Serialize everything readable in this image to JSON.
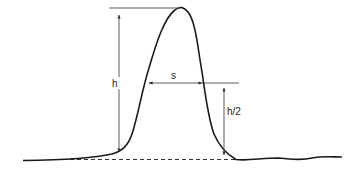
{
  "diagram": {
    "colors": {
      "line": "#1a1a1a",
      "annotation": "#333333",
      "background": "#ffffff"
    },
    "labels": {
      "height": "h",
      "width": "s",
      "half_height": "h/2"
    },
    "elements": [
      {
        "id": "peak-curve",
        "type": "curve",
        "description": "Single Gaussian-like peak rising from flat baseline, with small ripples on the right tail"
      },
      {
        "id": "baseline",
        "type": "dashed-line",
        "description": "Baseline under the peak"
      },
      {
        "id": "height-arrow",
        "type": "double-arrow",
        "label": "h",
        "description": "Vertical arrow from baseline to peak maximum"
      },
      {
        "id": "width-arrow",
        "type": "double-arrow",
        "label": "s",
        "description": "Horizontal arrow measuring peak width at half height"
      },
      {
        "id": "half-height-arrow",
        "type": "double-arrow",
        "label": "h/2",
        "description": "Vertical arrow from baseline to half-height level"
      }
    ]
  }
}
